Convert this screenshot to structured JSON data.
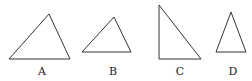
{
  "figure": {
    "triangles": [
      {
        "label": "A",
        "points": "9,59 70,59 49,14",
        "label_x": 42,
        "label_y": 75
      },
      {
        "label": "B",
        "points": "82,52 131,52 114,17",
        "label_x": 113,
        "label_y": 75
      },
      {
        "label": "C",
        "points": "159,5 159,59 201,59",
        "label_x": 180,
        "label_y": 75
      },
      {
        "label": "D",
        "points": "216,52 246,52 231,12",
        "label_x": 233,
        "label_y": 75
      }
    ]
  }
}
